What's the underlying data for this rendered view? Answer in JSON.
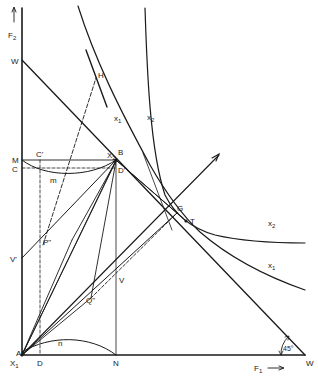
{
  "diagram": {
    "axes": {
      "y_axis_label": "F",
      "y_axis_sub": "2",
      "x_axis_label": "F",
      "x_axis_sub": "1",
      "origin_label": "A",
      "origin_axis_label": "X",
      "origin_axis_sub": "1"
    },
    "points": {
      "W_top": "W",
      "W_right": "W",
      "M": "M",
      "C": "C",
      "C_prime": "C'",
      "B": "B",
      "D_prime": "D'",
      "X2_near_B": "X",
      "X2_near_B_sub": "2",
      "V_prime": "V'",
      "P_double_prime": "P\"",
      "Q_double_prime": "Q\"",
      "V": "V",
      "D": "D",
      "N": "N",
      "G": "G",
      "T": "T",
      "H": "H"
    },
    "curves": {
      "x1_upper": {
        "label": "x",
        "sub": "1"
      },
      "x2_upper": {
        "label": "x",
        "sub": "2"
      },
      "x2_right": {
        "label": "x",
        "sub": "2"
      },
      "x1_right": {
        "label": "x",
        "sub": "1"
      },
      "m_curve": "m",
      "n_curve": "n"
    },
    "angle": "45°",
    "colors": {
      "ink": "#1a1a1a",
      "background": "#ffffff"
    }
  }
}
